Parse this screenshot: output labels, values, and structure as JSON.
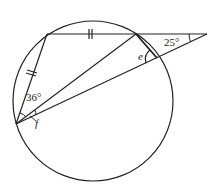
{
  "diagram": {
    "type": "circle-geometry",
    "circle": {
      "cx": 93,
      "cy": 101,
      "r": 80
    },
    "points": {
      "A": {
        "x": 47,
        "y": 34
      },
      "B": {
        "x": 136,
        "y": 34
      },
      "P": {
        "x": 207,
        "y": 34
      },
      "D": {
        "x": 16,
        "y": 124
      },
      "E": {
        "x": 157,
        "y": 58
      }
    },
    "labels": {
      "angle_p": "25°",
      "angle_a": "36°",
      "angle_e": "e",
      "angle_f": "f"
    },
    "stroke_color": "#222222"
  }
}
